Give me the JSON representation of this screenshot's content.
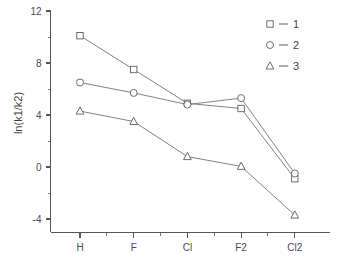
{
  "chart_data": {
    "type": "line",
    "title": "",
    "subtitle": "",
    "xlabel": "",
    "ylabel": "ln(k1/k2)",
    "categories": [
      "H",
      "F",
      "Cl",
      "F2",
      "Cl2"
    ],
    "series": [
      {
        "name": "1",
        "marker": "square",
        "values": [
          10.1,
          7.5,
          4.9,
          4.5,
          -0.9
        ]
      },
      {
        "name": "2",
        "marker": "circle",
        "values": [
          6.5,
          5.7,
          4.8,
          5.3,
          -0.5
        ]
      },
      {
        "name": "3",
        "marker": "triangle",
        "values": [
          4.3,
          3.5,
          0.8,
          0.05,
          -3.7
        ]
      }
    ],
    "ylim": [
      -5.5,
      12.4
    ],
    "xlim": [
      0,
      6
    ],
    "y_ticks_major": [
      -4,
      0,
      4,
      8,
      12
    ],
    "y_tick_labels": [
      "-4",
      "0",
      "4",
      "8",
      "12"
    ],
    "y_ticks_minor": [
      -2,
      2,
      6,
      10
    ],
    "grid": false,
    "legend_position": "top-right",
    "legend": [
      {
        "marker": "square",
        "dash": "–",
        "label": "1"
      },
      {
        "marker": "circle",
        "dash": "–",
        "label": "2"
      },
      {
        "marker": "triangle",
        "dash": "–",
        "label": "3"
      }
    ],
    "colors": {
      "axis": "#555555",
      "line": "#6b6b6b",
      "marker_stroke": "#5d5d5d",
      "marker_fill": "#ffffff",
      "text": "#4a4a4a",
      "background": "#ffffff"
    }
  }
}
